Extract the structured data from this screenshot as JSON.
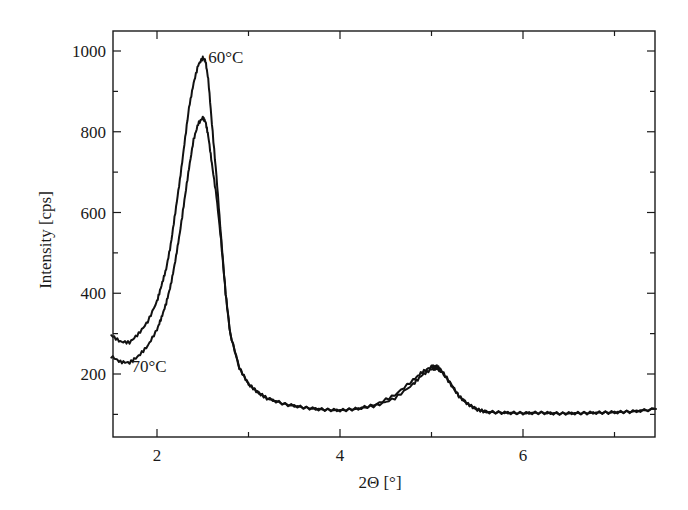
{
  "chart_data": {
    "type": "line",
    "title": "",
    "xlabel": "2Θ [°]",
    "ylabel": "Intensity [cps]",
    "xlim": [
      1.5,
      7.45
    ],
    "ylim": [
      42,
      1050
    ],
    "xticks": [
      2,
      4,
      6
    ],
    "xticks_minor": [
      3,
      5,
      7
    ],
    "yticks": [
      200,
      400,
      600,
      800,
      1000
    ],
    "yticks_minor": [
      100,
      300,
      500,
      700,
      900
    ],
    "grid": false,
    "legend": "none (inline curve annotations)",
    "annotations": [
      {
        "text": "60°C",
        "x": 2.56,
        "y": 980
      },
      {
        "text": "70°C",
        "x": 1.72,
        "y": 200
      }
    ],
    "series": [
      {
        "name": "60°C",
        "x": [
          1.5,
          1.6,
          1.7,
          1.8,
          1.9,
          2.0,
          2.05,
          2.1,
          2.15,
          2.2,
          2.25,
          2.3,
          2.35,
          2.4,
          2.45,
          2.5,
          2.53,
          2.56,
          2.6,
          2.65,
          2.7,
          2.75,
          2.8,
          2.9,
          3.0,
          3.1,
          3.2,
          3.4,
          3.6,
          3.8,
          4.0,
          4.2,
          4.4,
          4.6,
          4.8,
          4.9,
          5.0,
          5.05,
          5.1,
          5.2,
          5.3,
          5.4,
          5.5,
          5.6,
          5.8,
          6.0,
          6.2,
          6.4,
          6.6,
          6.8,
          7.0,
          7.2,
          7.45
        ],
        "y": [
          296,
          280,
          278,
          300,
          330,
          380,
          420,
          460,
          520,
          600,
          680,
          770,
          860,
          920,
          965,
          983,
          975,
          930,
          820,
          690,
          540,
          400,
          300,
          215,
          175,
          155,
          140,
          125,
          117,
          112,
          110,
          114,
          125,
          148,
          185,
          205,
          218,
          220,
          212,
          180,
          145,
          125,
          112,
          106,
          104,
          103,
          104,
          102,
          103,
          104,
          105,
          107,
          113
        ]
      },
      {
        "name": "70°C",
        "x": [
          1.5,
          1.6,
          1.7,
          1.8,
          1.9,
          2.0,
          2.05,
          2.1,
          2.15,
          2.2,
          2.25,
          2.3,
          2.35,
          2.4,
          2.45,
          2.5,
          2.53,
          2.56,
          2.6,
          2.65,
          2.7,
          2.75,
          2.8,
          2.9,
          3.0,
          3.1,
          3.2,
          3.4,
          3.6,
          3.8,
          4.0,
          4.2,
          4.4,
          4.6,
          4.8,
          4.9,
          5.0,
          5.05,
          5.1,
          5.2,
          5.3,
          5.4,
          5.5,
          5.6,
          5.8,
          6.0,
          6.2,
          6.4,
          6.6,
          6.8,
          7.0,
          7.2,
          7.45
        ],
        "y": [
          244,
          230,
          228,
          245,
          270,
          310,
          340,
          375,
          420,
          480,
          550,
          630,
          710,
          780,
          820,
          835,
          825,
          790,
          720,
          640,
          530,
          400,
          300,
          215,
          175,
          155,
          140,
          125,
          117,
          112,
          110,
          114,
          122,
          140,
          175,
          198,
          212,
          214,
          208,
          178,
          145,
          125,
          112,
          106,
          104,
          103,
          104,
          102,
          103,
          104,
          105,
          107,
          113
        ]
      }
    ]
  },
  "layout": {
    "plot_left": 113,
    "plot_right": 655,
    "plot_top": 31,
    "plot_bottom": 437,
    "x_ref": [
      [
        2,
        157
      ],
      [
        4,
        340
      ]
    ],
    "y_ref": [
      [
        200,
        374
      ],
      [
        1000,
        51
      ]
    ]
  }
}
